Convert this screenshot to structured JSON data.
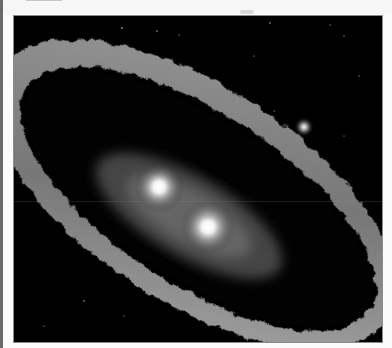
{
  "page": {
    "type": "document-page",
    "caption_fragment_visible": false
  },
  "figure": {
    "elements": [
      {
        "name": "outer-dust-ring",
        "description": "wide grey textured ring tilted diagonally"
      },
      {
        "name": "inner-disk",
        "description": "faint hazy inner disk surrounding two stars"
      },
      {
        "name": "binary-star-a",
        "x": 158,
        "y": 186
      },
      {
        "name": "binary-star-b",
        "x": 207,
        "y": 226
      },
      {
        "name": "distant-companion-star",
        "x": 303,
        "y": 126
      }
    ],
    "colors": {
      "background": "#000000",
      "ring": "#9a9a9a",
      "star_core": "#ffffff",
      "frame": "#8a8a8a"
    }
  }
}
